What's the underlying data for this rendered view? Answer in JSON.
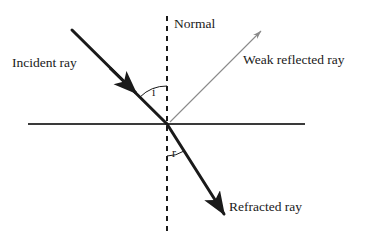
{
  "figure": {
    "background_color": "#ffffff",
    "width": 370,
    "height": 245
  },
  "labels": {
    "incident_ray": "Incident ray",
    "normal": "Normal",
    "weak_reflected_ray": "Weak reflected ray",
    "refracted_ray": "Refracted ray",
    "angle_of_incidence": "i",
    "angle_of_refraction": "r"
  },
  "colors": {
    "ray_dark": "#1a1a1a",
    "reflected_ray_gray": "#8a8a8a",
    "interface_line": "#3a3a3a",
    "normal_dashed": "#1a1a1a",
    "text": "#1a1a1a"
  },
  "geometry": {
    "origin": {
      "x": 167,
      "y": 124
    },
    "interface_line": {
      "x1": 28,
      "y1": 124,
      "x2": 305,
      "y2": 124
    },
    "normal_line": {
      "x1": 167,
      "y1": 16,
      "x2": 167,
      "y2": 232,
      "dashed": true
    },
    "incident_ray": {
      "x1": 72,
      "y1": 30,
      "x2": 167,
      "y2": 124,
      "arrow_at": {
        "x": 133,
        "y": 90
      }
    },
    "reflected_ray": {
      "x1": 167,
      "y1": 124,
      "x2": 261,
      "y2": 30,
      "arrow_at": {
        "x": 261,
        "y": 30
      }
    },
    "refracted_ray": {
      "x1": 167,
      "y1": 124,
      "x2": 224,
      "y2": 214,
      "arrow_at": {
        "x": 224,
        "y": 214
      }
    },
    "arc_incidence": {
      "radius": 38,
      "from_deg": 225,
      "to_deg": 270
    },
    "arc_refraction": {
      "radius": 32,
      "from_deg": 90,
      "to_deg": 58
    }
  }
}
